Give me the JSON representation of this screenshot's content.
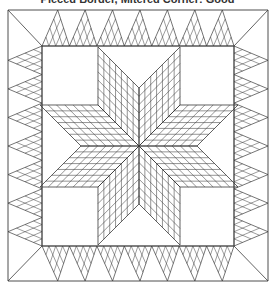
{
  "title": "Pieced Border, Mitered Corner: Good",
  "diagram": {
    "type": "quilt-pattern",
    "stroke_color": "#3a3a3a",
    "background": "#ffffff",
    "outer_square": {
      "x1": 8,
      "y1": 10,
      "x2": 268,
      "y2": 281
    },
    "inner_square": {
      "x1": 42,
      "y1": 46,
      "x2": 234,
      "y2": 246
    },
    "star": {
      "center": [
        139,
        146
      ],
      "points": 8,
      "diamond_side": 58,
      "subdivisions": 7
    },
    "border": {
      "triangles_per_side": 7,
      "lattice_divisions": 4,
      "mitered_corners": true
    }
  }
}
